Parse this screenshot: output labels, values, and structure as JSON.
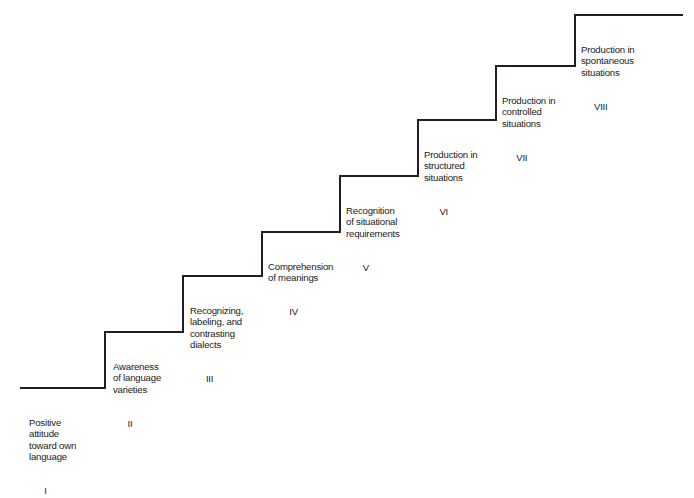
{
  "diagram": {
    "type": "staircase-progression",
    "orientation": "ascending-left-to-right",
    "background_color": "#ffffff",
    "line_color": "#231f20",
    "text_color": "#1a1a1a",
    "step_count": 8,
    "steps": [
      {
        "numeral": "I",
        "lines": [
          "Positive",
          "attitude",
          "toward own",
          "language"
        ],
        "text": "Positive attitude toward own language",
        "tread_y": 388,
        "tread_x_start": 20,
        "tread_x_end": 105,
        "label_left": 29,
        "label_top": 394
      },
      {
        "numeral": "II",
        "lines": [
          "Awareness",
          "of language",
          "varieties"
        ],
        "text": "Awareness of language varieties",
        "tread_y": 332,
        "tread_x_start": 105,
        "tread_x_end": 183,
        "label_left": 113,
        "label_top": 338
      },
      {
        "numeral": "III",
        "lines": [
          "Recognizing,",
          "labeling, and",
          "contrasting",
          "dialects"
        ],
        "text": "Recognizing, labeling, and contrasting dialects",
        "tread_y": 276,
        "tread_x_start": 183,
        "tread_x_end": 262,
        "label_left": 190,
        "label_top": 282
      },
      {
        "numeral": "IV",
        "lines": [
          "Comprehension",
          "of meanings"
        ],
        "text": "Comprehension of meanings",
        "tread_y": 232,
        "tread_x_start": 262,
        "tread_x_end": 340,
        "label_left": 268,
        "label_top": 238
      },
      {
        "numeral": "V",
        "lines": [
          "Recognition",
          "of situational",
          "requirements"
        ],
        "text": "Recognition of situational requirements",
        "tread_y": 176,
        "tread_x_start": 340,
        "tread_x_end": 418,
        "label_left": 346,
        "label_top": 182
      },
      {
        "numeral": "VI",
        "lines": [
          "Production in",
          "structured",
          "situations"
        ],
        "text": "Production in structured situations",
        "tread_y": 120,
        "tread_x_start": 418,
        "tread_x_end": 496,
        "label_left": 424,
        "label_top": 126
      },
      {
        "numeral": "VII",
        "lines": [
          "Production in",
          "controlled",
          "situations"
        ],
        "text": "Production in controlled situations",
        "tread_y": 66,
        "tread_x_start": 496,
        "tread_x_end": 575,
        "label_left": 502,
        "label_top": 72
      },
      {
        "numeral": "VIII",
        "lines": [
          "Production in",
          "spontaneous",
          "situations"
        ],
        "text": "Production in spontaneous situations",
        "tread_y": 15,
        "tread_x_start": 575,
        "tread_x_end": 683,
        "label_left": 581,
        "label_top": 21
      }
    ]
  }
}
